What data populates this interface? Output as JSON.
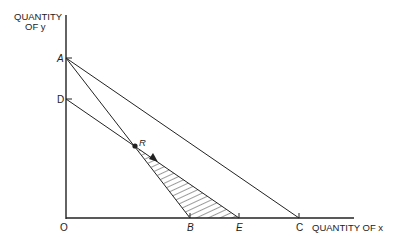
{
  "diagram": {
    "y_axis_label_line1": "QUANTITY",
    "y_axis_label_line2": "OF y",
    "x_axis_label": "QUANTITY OF x",
    "points": {
      "A": "A",
      "D": "D",
      "O": "O",
      "B": "B",
      "E": "E",
      "C": "C",
      "R": "R"
    },
    "lines": [
      {
        "name": "AC",
        "from": "A",
        "to": "C"
      },
      {
        "name": "AB",
        "from": "A",
        "to": "B"
      },
      {
        "name": "DE",
        "from": "D",
        "to": "E"
      }
    ],
    "shaded_region": "R-B-E triangle (hatched)",
    "arrow": "from R along line toward E",
    "colors": {
      "ink": "#222222",
      "background": "#ffffff"
    }
  }
}
